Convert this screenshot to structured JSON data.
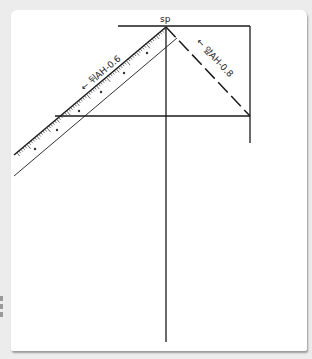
{
  "diagram": {
    "type": "pattern-drafting",
    "point_label": "sp",
    "labels": {
      "back_armhole": "← 뒤AH-0.6",
      "front_armhole": "← 앞AH-0.8"
    },
    "colors": {
      "background": "#ececec",
      "paper": "#ffffff",
      "line": "#1a1a1a",
      "ruler": "#333333"
    }
  }
}
